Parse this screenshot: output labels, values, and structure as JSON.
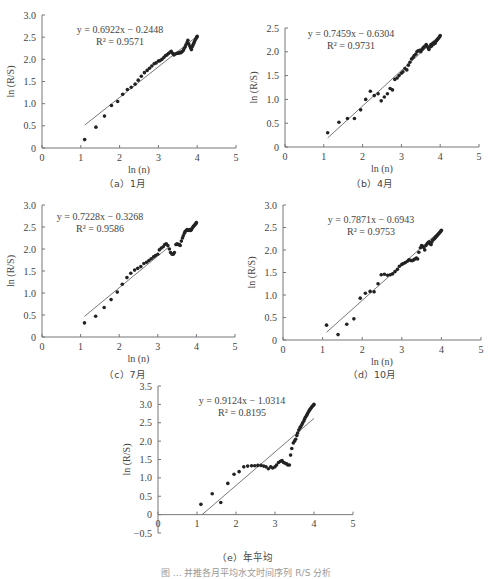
{
  "chart_data": [
    {
      "id": "a",
      "type": "scatter",
      "caption": "（a）1月",
      "xlabel": "ln (n)",
      "ylabel": "ln (R/S)",
      "xlim": [
        0,
        5
      ],
      "ylim": [
        0,
        3.0
      ],
      "xticks": [
        "0",
        "1",
        "2",
        "3",
        "4",
        "5"
      ],
      "yticks": [
        "0",
        "0.5",
        "1.0",
        "1.5",
        "2.0",
        "2.5",
        "3.0"
      ],
      "equation": "y = 0.6922x − 0.2448",
      "r2": "R² = 0.9571",
      "fit": {
        "slope": 0.6922,
        "intercept": -0.2448,
        "x_range": [
          1.1,
          4.0
        ]
      },
      "points": [
        [
          1.1,
          0.19
        ],
        [
          1.39,
          0.47
        ],
        [
          1.61,
          0.72
        ],
        [
          1.79,
          0.96
        ],
        [
          1.95,
          1.05
        ],
        [
          2.08,
          1.21
        ],
        [
          2.2,
          1.32
        ],
        [
          2.3,
          1.37
        ],
        [
          2.4,
          1.44
        ],
        [
          2.48,
          1.53
        ],
        [
          2.56,
          1.62
        ],
        [
          2.64,
          1.7
        ],
        [
          2.71,
          1.75
        ],
        [
          2.77,
          1.8
        ],
        [
          2.83,
          1.85
        ],
        [
          2.89,
          1.9
        ],
        [
          2.94,
          1.92
        ],
        [
          3.0,
          1.96
        ],
        [
          3.04,
          1.97
        ],
        [
          3.09,
          2.0
        ],
        [
          3.14,
          2.04
        ],
        [
          3.18,
          2.08
        ],
        [
          3.22,
          2.1
        ],
        [
          3.26,
          2.13
        ],
        [
          3.3,
          2.16
        ],
        [
          3.33,
          2.18
        ],
        [
          3.37,
          2.13
        ],
        [
          3.4,
          2.1
        ],
        [
          3.43,
          2.12
        ],
        [
          3.47,
          2.13
        ],
        [
          3.5,
          2.14
        ],
        [
          3.53,
          2.14
        ],
        [
          3.56,
          2.16
        ],
        [
          3.58,
          2.15
        ],
        [
          3.61,
          2.17
        ],
        [
          3.64,
          2.2
        ],
        [
          3.66,
          2.24
        ],
        [
          3.69,
          2.28
        ],
        [
          3.71,
          2.33
        ],
        [
          3.74,
          2.38
        ],
        [
          3.76,
          2.43
        ],
        [
          3.78,
          2.35
        ],
        [
          3.81,
          2.3
        ],
        [
          3.83,
          2.26
        ],
        [
          3.85,
          2.22
        ],
        [
          3.87,
          2.28
        ],
        [
          3.89,
          2.32
        ],
        [
          3.91,
          2.36
        ],
        [
          3.93,
          2.4
        ],
        [
          3.95,
          2.44
        ],
        [
          3.97,
          2.47
        ],
        [
          3.99,
          2.5
        ],
        [
          4.0,
          2.52
        ]
      ]
    },
    {
      "id": "b",
      "type": "scatter",
      "caption": "（b）4月",
      "xlabel": "ln (n)",
      "ylabel": "ln (R/S)",
      "xlim": [
        0,
        5
      ],
      "ylim": [
        0,
        2.5
      ],
      "xticks": [
        "0",
        "1",
        "2",
        "3",
        "4",
        "5"
      ],
      "yticks": [
        "0",
        "0.5",
        "1.0",
        "1.5",
        "2.0",
        "2.5"
      ],
      "equation": "y = 0.7459x − 0.6304",
      "r2": "R² = 0.9731",
      "fit": {
        "slope": 0.7459,
        "intercept": -0.6304,
        "x_range": [
          1.1,
          4.0
        ]
      },
      "points": [
        [
          1.1,
          0.3
        ],
        [
          1.39,
          0.52
        ],
        [
          1.61,
          0.6
        ],
        [
          1.79,
          0.6
        ],
        [
          1.95,
          0.78
        ],
        [
          2.08,
          1.0
        ],
        [
          2.2,
          1.17
        ],
        [
          2.3,
          1.08
        ],
        [
          2.4,
          1.12
        ],
        [
          2.48,
          0.97
        ],
        [
          2.56,
          1.05
        ],
        [
          2.64,
          1.12
        ],
        [
          2.71,
          1.23
        ],
        [
          2.77,
          1.2
        ],
        [
          2.83,
          1.42
        ],
        [
          2.89,
          1.45
        ],
        [
          2.94,
          1.5
        ],
        [
          3.0,
          1.55
        ],
        [
          3.04,
          1.58
        ],
        [
          3.09,
          1.65
        ],
        [
          3.14,
          1.62
        ],
        [
          3.18,
          1.72
        ],
        [
          3.22,
          1.78
        ],
        [
          3.26,
          1.85
        ],
        [
          3.3,
          1.88
        ],
        [
          3.33,
          1.92
        ],
        [
          3.37,
          1.95
        ],
        [
          3.4,
          2.0
        ],
        [
          3.43,
          2.02
        ],
        [
          3.47,
          2.03
        ],
        [
          3.5,
          2.0
        ],
        [
          3.53,
          2.05
        ],
        [
          3.56,
          2.08
        ],
        [
          3.58,
          2.1
        ],
        [
          3.61,
          2.12
        ],
        [
          3.64,
          2.15
        ],
        [
          3.66,
          2.12
        ],
        [
          3.69,
          2.08
        ],
        [
          3.71,
          2.05
        ],
        [
          3.74,
          2.1
        ],
        [
          3.76,
          2.15
        ],
        [
          3.78,
          2.12
        ],
        [
          3.81,
          2.18
        ],
        [
          3.83,
          2.16
        ],
        [
          3.85,
          2.2
        ],
        [
          3.87,
          2.18
        ],
        [
          3.89,
          2.22
        ],
        [
          3.91,
          2.24
        ],
        [
          3.93,
          2.26
        ],
        [
          3.95,
          2.28
        ],
        [
          3.97,
          2.3
        ],
        [
          3.99,
          2.32
        ],
        [
          4.0,
          2.34
        ]
      ]
    },
    {
      "id": "c",
      "type": "scatter",
      "caption": "（c）7月",
      "xlabel": "ln (n)",
      "ylabel": "ln (R/S)",
      "xlim": [
        0,
        5
      ],
      "ylim": [
        0,
        3.0
      ],
      "xticks": [
        "0",
        "1",
        "2",
        "3",
        "4",
        "5"
      ],
      "yticks": [
        "0",
        "0.5",
        "1.0",
        "1.5",
        "2.0",
        "2.5",
        "3.0"
      ],
      "equation": "y = 0.7228x − 0.3268",
      "r2": "R² = 0.9586",
      "fit": {
        "slope": 0.7228,
        "intercept": -0.3268,
        "x_range": [
          1.1,
          3.3
        ]
      },
      "points": [
        [
          1.1,
          0.32
        ],
        [
          1.39,
          0.47
        ],
        [
          1.61,
          0.67
        ],
        [
          1.79,
          0.85
        ],
        [
          1.95,
          1.02
        ],
        [
          2.08,
          1.2
        ],
        [
          2.2,
          1.35
        ],
        [
          2.3,
          1.45
        ],
        [
          2.4,
          1.52
        ],
        [
          2.48,
          1.56
        ],
        [
          2.56,
          1.6
        ],
        [
          2.64,
          1.67
        ],
        [
          2.71,
          1.7
        ],
        [
          2.77,
          1.74
        ],
        [
          2.83,
          1.78
        ],
        [
          2.89,
          1.82
        ],
        [
          2.94,
          1.85
        ],
        [
          3.0,
          1.88
        ],
        [
          3.04,
          1.98
        ],
        [
          3.09,
          2.02
        ],
        [
          3.14,
          2.05
        ],
        [
          3.18,
          2.1
        ],
        [
          3.22,
          2.12
        ],
        [
          3.26,
          2.08
        ],
        [
          3.3,
          2.0
        ],
        [
          3.33,
          1.92
        ],
        [
          3.37,
          1.88
        ],
        [
          3.4,
          1.88
        ],
        [
          3.43,
          1.92
        ],
        [
          3.47,
          2.1
        ],
        [
          3.5,
          2.12
        ],
        [
          3.53,
          2.1
        ],
        [
          3.56,
          2.1
        ],
        [
          3.58,
          2.08
        ],
        [
          3.61,
          2.18
        ],
        [
          3.64,
          2.25
        ],
        [
          3.66,
          2.3
        ],
        [
          3.69,
          2.36
        ],
        [
          3.71,
          2.4
        ],
        [
          3.74,
          2.42
        ],
        [
          3.76,
          2.44
        ],
        [
          3.78,
          2.43
        ],
        [
          3.81,
          2.42
        ],
        [
          3.83,
          2.44
        ],
        [
          3.85,
          2.42
        ],
        [
          3.87,
          2.44
        ],
        [
          3.89,
          2.47
        ],
        [
          3.91,
          2.5
        ],
        [
          3.93,
          2.52
        ],
        [
          3.95,
          2.54
        ],
        [
          3.97,
          2.56
        ],
        [
          3.99,
          2.58
        ],
        [
          4.0,
          2.6
        ]
      ]
    },
    {
      "id": "d",
      "type": "scatter",
      "caption": "（d）10月",
      "xlabel": "ln (n)",
      "ylabel": "ln (R/S)",
      "xlim": [
        0,
        5
      ],
      "ylim": [
        0,
        3.0
      ],
      "xticks": [
        "0",
        "1",
        "2",
        "3",
        "4",
        "5"
      ],
      "yticks": [
        "0",
        "0.5",
        "1.0",
        "1.5",
        "2.0",
        "2.5",
        "3.0"
      ],
      "equation": "y = 0.7871x − 0.6943",
      "r2": "R² = 0.9753",
      "fit": {
        "slope": 0.7871,
        "intercept": -0.6943,
        "x_range": [
          1.1,
          4.0
        ]
      },
      "points": [
        [
          1.1,
          0.33
        ],
        [
          1.39,
          0.12
        ],
        [
          1.61,
          0.35
        ],
        [
          1.79,
          0.47
        ],
        [
          1.95,
          0.93
        ],
        [
          2.08,
          1.04
        ],
        [
          2.2,
          1.08
        ],
        [
          2.3,
          1.07
        ],
        [
          2.4,
          1.25
        ],
        [
          2.48,
          1.45
        ],
        [
          2.56,
          1.46
        ],
        [
          2.64,
          1.44
        ],
        [
          2.71,
          1.45
        ],
        [
          2.77,
          1.47
        ],
        [
          2.83,
          1.52
        ],
        [
          2.89,
          1.57
        ],
        [
          2.94,
          1.64
        ],
        [
          3.0,
          1.68
        ],
        [
          3.04,
          1.7
        ],
        [
          3.09,
          1.72
        ],
        [
          3.14,
          1.75
        ],
        [
          3.18,
          1.78
        ],
        [
          3.22,
          1.77
        ],
        [
          3.26,
          1.76
        ],
        [
          3.3,
          1.78
        ],
        [
          3.33,
          1.8
        ],
        [
          3.37,
          1.82
        ],
        [
          3.4,
          1.8
        ],
        [
          3.43,
          1.95
        ],
        [
          3.47,
          2.05
        ],
        [
          3.5,
          2.1
        ],
        [
          3.53,
          2.08
        ],
        [
          3.56,
          2.05
        ],
        [
          3.58,
          2.0
        ],
        [
          3.61,
          2.1
        ],
        [
          3.64,
          2.14
        ],
        [
          3.66,
          2.16
        ],
        [
          3.69,
          2.18
        ],
        [
          3.71,
          2.14
        ],
        [
          3.74,
          2.12
        ],
        [
          3.76,
          2.18
        ],
        [
          3.78,
          2.22
        ],
        [
          3.81,
          2.24
        ],
        [
          3.83,
          2.26
        ],
        [
          3.85,
          2.28
        ],
        [
          3.87,
          2.3
        ],
        [
          3.89,
          2.32
        ],
        [
          3.91,
          2.34
        ],
        [
          3.93,
          2.36
        ],
        [
          3.95,
          2.38
        ],
        [
          3.97,
          2.4
        ],
        [
          3.99,
          2.42
        ],
        [
          4.0,
          2.44
        ]
      ]
    },
    {
      "id": "e",
      "type": "scatter",
      "caption": "（e）年平均",
      "xlabel": "ln (n)",
      "ylabel": "ln (R/S)",
      "xlim": [
        0,
        5
      ],
      "ylim": [
        -0.5,
        3.5
      ],
      "xticks": [
        "0",
        "1",
        "2",
        "3",
        "4",
        "5"
      ],
      "yticks": [
        "−0.5",
        "0",
        "0.5",
        "1.0",
        "1.5",
        "2.0",
        "2.5",
        "3.0",
        "3.5"
      ],
      "equation": "y = 0.9124x − 1.0314",
      "r2": "R² = 0.8195",
      "fit": {
        "slope": 0.9124,
        "intercept": -1.0314,
        "x_range": [
          1.13,
          4.0
        ]
      },
      "points": [
        [
          1.1,
          0.28
        ],
        [
          1.39,
          0.57
        ],
        [
          1.61,
          0.33
        ],
        [
          1.79,
          0.85
        ],
        [
          1.95,
          1.1
        ],
        [
          2.08,
          1.17
        ],
        [
          2.2,
          1.3
        ],
        [
          2.3,
          1.32
        ],
        [
          2.4,
          1.33
        ],
        [
          2.48,
          1.33
        ],
        [
          2.56,
          1.34
        ],
        [
          2.64,
          1.34
        ],
        [
          2.71,
          1.32
        ],
        [
          2.77,
          1.3
        ],
        [
          2.83,
          1.25
        ],
        [
          2.89,
          1.3
        ],
        [
          2.94,
          1.27
        ],
        [
          3.0,
          1.3
        ],
        [
          3.04,
          1.35
        ],
        [
          3.09,
          1.42
        ],
        [
          3.14,
          1.45
        ],
        [
          3.18,
          1.47
        ],
        [
          3.22,
          1.42
        ],
        [
          3.26,
          1.4
        ],
        [
          3.3,
          1.38
        ],
        [
          3.33,
          1.35
        ],
        [
          3.37,
          1.35
        ],
        [
          3.4,
          1.62
        ],
        [
          3.43,
          1.8
        ],
        [
          3.47,
          1.95
        ],
        [
          3.5,
          2.0
        ],
        [
          3.53,
          2.05
        ],
        [
          3.56,
          2.15
        ],
        [
          3.58,
          2.22
        ],
        [
          3.61,
          2.3
        ],
        [
          3.64,
          2.36
        ],
        [
          3.66,
          2.4
        ],
        [
          3.69,
          2.45
        ],
        [
          3.71,
          2.5
        ],
        [
          3.74,
          2.55
        ],
        [
          3.76,
          2.6
        ],
        [
          3.78,
          2.65
        ],
        [
          3.81,
          2.7
        ],
        [
          3.83,
          2.74
        ],
        [
          3.85,
          2.78
        ],
        [
          3.87,
          2.82
        ],
        [
          3.89,
          2.85
        ],
        [
          3.91,
          2.88
        ],
        [
          3.93,
          2.91
        ],
        [
          3.95,
          2.94
        ],
        [
          3.97,
          2.96
        ],
        [
          3.99,
          2.98
        ],
        [
          4.0,
          3.0
        ]
      ]
    }
  ],
  "figure_caption": "图 … 并推各月平均水文时间序列 R/S 分析"
}
